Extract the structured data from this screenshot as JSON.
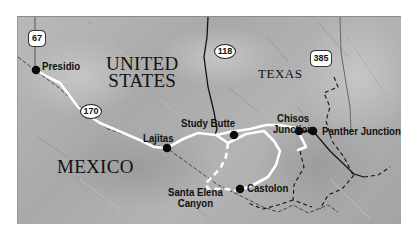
{
  "map": {
    "title": "Big Bend region route map",
    "colors": {
      "terrain": "#b0b0b0",
      "route": "#ffffff",
      "road": "#111111",
      "border": "#222222",
      "frame_bg": "#ffffff"
    },
    "regions": {
      "us_line1": "UNITED",
      "us_line2": "STATES",
      "state": "TEXAS",
      "mexico": "MEXICO"
    },
    "highways": [
      {
        "id": "us-67",
        "label": "67",
        "type": "US"
      },
      {
        "id": "fm-170",
        "label": "170",
        "type": "state"
      },
      {
        "id": "tx-118",
        "label": "118",
        "type": "state"
      },
      {
        "id": "us-385",
        "label": "385",
        "type": "US"
      }
    ],
    "places": [
      {
        "id": "presidio",
        "name": "Presidio"
      },
      {
        "id": "lajitas",
        "name": "Lajitas"
      },
      {
        "id": "study-butte",
        "name": "Study Butte"
      },
      {
        "id": "chisos-junction",
        "line1": "Chisos",
        "line2": "Junction"
      },
      {
        "id": "panther-junction",
        "name": "Panther Junction"
      },
      {
        "id": "santa-elena-canyon",
        "line1": "Santa Elena",
        "line2": "Canyon"
      },
      {
        "id": "castolon",
        "name": "Castolon"
      }
    ]
  }
}
